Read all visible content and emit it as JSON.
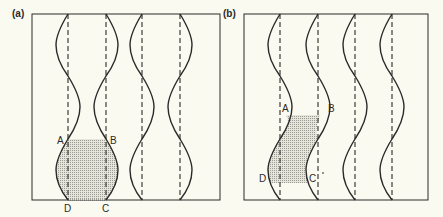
{
  "panels": [
    {
      "id": "a",
      "label": "(a)",
      "description": "Vertical dashed lines with alternating-phase sinusoidal curves; shaded region ABCD at bottom",
      "points": {
        "A": "A",
        "B": "B",
        "C": "C",
        "D": "D"
      }
    },
    {
      "id": "b",
      "label": "(b)",
      "description": "Vertical dashed lines with in-phase sinusoidal curves; shaded sheared region ABCD in middle",
      "points": {
        "A": "A",
        "B": "B",
        "C": "C",
        "D": "D"
      }
    }
  ],
  "colors": {
    "background": "#fbfaf0",
    "line": "#2a2a2a",
    "shade": "#bdbdb5"
  }
}
